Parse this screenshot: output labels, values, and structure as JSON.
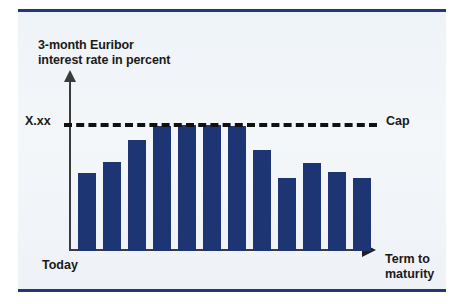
{
  "chart_data": {
    "type": "bar",
    "title": "3-month Euribor\ninterest rate in percent",
    "xlabel": "Term to\nmaturity",
    "ylabel": "3-month Euribor interest rate in percent",
    "origin_label": "Today",
    "cap_label": "Cap",
    "cap_value_label": "X.xx",
    "grid": false,
    "legend": "none",
    "axis_range_note": "unlabeled schematic axes",
    "cap_level": 100,
    "categories": [
      "1",
      "2",
      "3",
      "4",
      "5",
      "6",
      "7",
      "8",
      "9",
      "10",
      "11",
      "12"
    ],
    "series": [
      {
        "name": "Euribor rate paid (capped)",
        "color": "#1d3572",
        "values": [
          62,
          71,
          88,
          99,
          100,
          100,
          99,
          80,
          58,
          70,
          63,
          58
        ]
      },
      {
        "name": "Amount above cap (hedged)",
        "color": "#8e9cba",
        "values": [
          0,
          0,
          0,
          129,
          129,
          136,
          117,
          0,
          0,
          0,
          0,
          0
        ]
      }
    ],
    "annotations": [
      {
        "text": "Cap",
        "position": "right-of-dashed-line"
      },
      {
        "text": "X.xx",
        "position": "left-of-dashed-line"
      },
      {
        "text": "Today",
        "position": "below-origin"
      },
      {
        "text": "Term to maturity",
        "position": "right-of-x-axis"
      }
    ]
  },
  "colors": {
    "bar_primary": "#1d3572",
    "bar_cap_overlay": "#8e9cba",
    "rule": "#23387a",
    "axis": "#3b3b3b",
    "text": "#1a1a1a",
    "paper": "#eef3f8"
  },
  "geometry": {
    "baseline_y": 251,
    "cap_y": 125,
    "bar_slots_x": [
      78,
      103,
      128,
      153,
      178,
      203,
      228,
      253,
      278,
      303,
      328,
      353
    ],
    "bar_width": 18
  }
}
